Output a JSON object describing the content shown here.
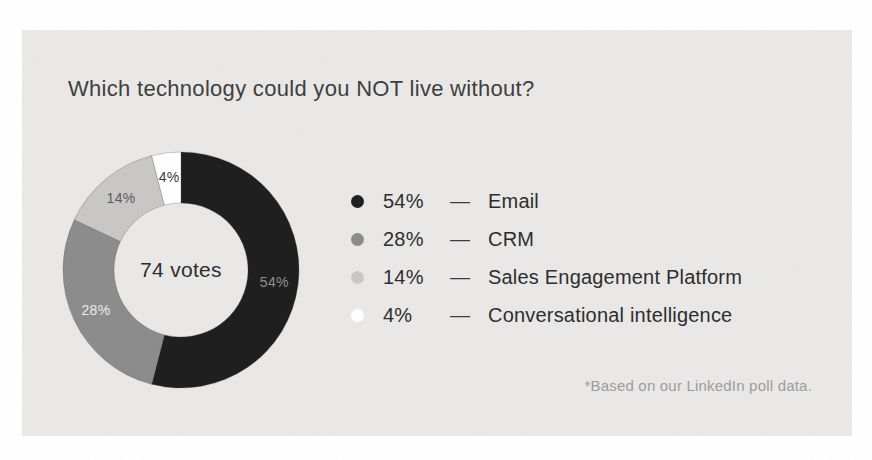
{
  "card": {
    "title": "Which technology could you NOT live without?",
    "footnote": "*Based on our LinkedIn poll data.",
    "background": "#e9e8e6"
  },
  "chart_data": {
    "type": "pie",
    "subtype": "donut",
    "title": "Which technology could you NOT live without?",
    "center_label": "74 votes",
    "total_votes": 74,
    "unit": "%",
    "direction": "clockwise",
    "start_angle_deg": 0,
    "categories": [
      "Email",
      "CRM",
      "Sales Engagement Platform",
      "Conversational intelligence"
    ],
    "values": [
      54,
      28,
      14,
      4
    ],
    "colors": [
      "#1d1d1d",
      "#8b8b8b",
      "#c8c7c5",
      "#ffffff"
    ],
    "slice_labels": [
      "54%",
      "28%",
      "14%",
      "4%"
    ],
    "slice_label_colors": [
      "#8f8f8f",
      "#ececec",
      "#5a5a5a",
      "#3a3a3a"
    ],
    "legend_position": "right",
    "legend": [
      {
        "percent": "54%",
        "separator": "—",
        "label": "Email",
        "color": "#1d1d1d"
      },
      {
        "percent": "28%",
        "separator": "—",
        "label": "CRM",
        "color": "#8b8b8b"
      },
      {
        "percent": "14%",
        "separator": "—",
        "label": "Sales Engagement Platform",
        "color": "#c8c7c5"
      },
      {
        "percent": "4%",
        "separator": "—",
        "label": "Conversational intelligence",
        "color": "#ffffff"
      }
    ]
  }
}
